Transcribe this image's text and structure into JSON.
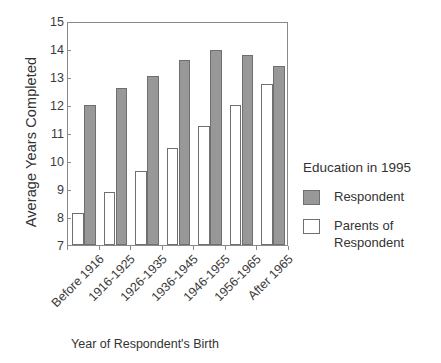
{
  "chart_data": {
    "type": "bar",
    "title": "",
    "xlabel": "Year of Respondent's Birth",
    "ylabel": "Average Years Completed",
    "categories": [
      "Before 1916",
      "1916-1925",
      "1926-1935",
      "1936-1945",
      "1946-1955",
      "1956-1965",
      "After 1965"
    ],
    "series": [
      {
        "name": "Respondent",
        "color": "#989898",
        "values": [
          12.0,
          12.6,
          13.05,
          13.6,
          13.95,
          13.8,
          13.4
        ]
      },
      {
        "name": "Parents of Respondent",
        "color": "#ffffff",
        "values": [
          8.15,
          8.9,
          9.65,
          10.45,
          11.25,
          12.0,
          12.75
        ]
      }
    ],
    "ylim": [
      7,
      15
    ],
    "yticks": [
      7,
      8,
      9,
      10,
      11,
      12,
      13,
      14,
      15
    ],
    "ytick_labels": [
      "7",
      "8",
      "9",
      "10",
      "11",
      "12",
      "13",
      "14",
      "15"
    ],
    "grid": false,
    "legend_position": "right"
  },
  "legend": {
    "title": "Education in 1995",
    "entries": [
      {
        "label": "Respondent",
        "swatch": "respondent"
      },
      {
        "label": "Parents of\nRespondent",
        "swatch": "parents"
      }
    ],
    "entry_0_label": "Respondent",
    "entry_1_label_line1": "Parents of",
    "entry_1_label_line2": "Respondent"
  },
  "axes": {
    "y_title": "Average Years Completed",
    "x_title": "Year of Respondent's Birth"
  }
}
